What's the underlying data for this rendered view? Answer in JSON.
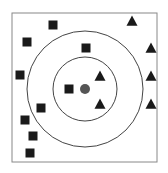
{
  "diagram": {
    "type": "knn-classification",
    "colors": {
      "frame": "#888888",
      "circle": "#444444",
      "square": "#1a1a1a",
      "triangle": "#1a1a1a",
      "query": "#555555"
    },
    "frame": {
      "x": 12,
      "y": 13,
      "width": 145,
      "height": 149
    },
    "query_point": {
      "x": 85,
      "y": 89,
      "r": 5
    },
    "circles": [
      {
        "name": "inner-k-radius",
        "cx": 85,
        "cy": 89,
        "r": 32
      },
      {
        "name": "outer-k-radius",
        "cx": 85,
        "cy": 89,
        "r": 58
      }
    ],
    "squares": [
      {
        "x": 53,
        "y": 25
      },
      {
        "x": 27,
        "y": 42
      },
      {
        "x": 86,
        "y": 48
      },
      {
        "x": 20,
        "y": 75
      },
      {
        "x": 69,
        "y": 89
      },
      {
        "x": 41,
        "y": 108
      },
      {
        "x": 25,
        "y": 120
      },
      {
        "x": 33,
        "y": 136
      },
      {
        "x": 30,
        "y": 153
      }
    ],
    "triangles": [
      {
        "x": 132,
        "y": 21
      },
      {
        "x": 151,
        "y": 48
      },
      {
        "x": 100,
        "y": 76
      },
      {
        "x": 151,
        "y": 76
      },
      {
        "x": 100,
        "y": 104
      },
      {
        "x": 151,
        "y": 104
      }
    ]
  }
}
